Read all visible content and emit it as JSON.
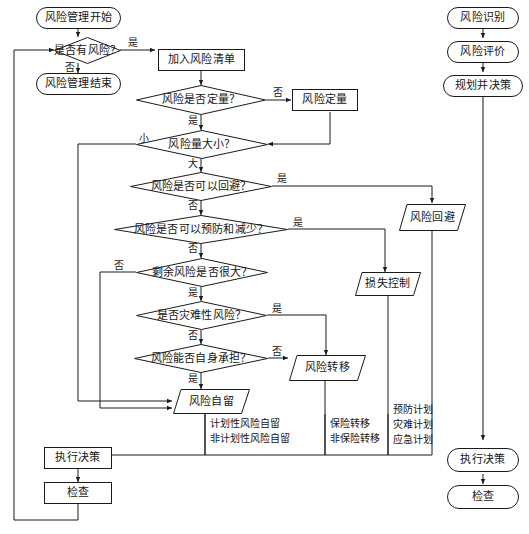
{
  "diagram": {
    "language": "zh-CN",
    "stroke_color": "#1a1a1a",
    "text_color": "#151515",
    "background": "#ffffff"
  },
  "nodes": {
    "start": "风险管理开始",
    "has_risk": "是否有风险？",
    "end": "风险管理结束",
    "add_list": "加入风险清单",
    "is_quant": "风险是否定量？",
    "quantify": "风险定量",
    "risk_size": "风险量大小？",
    "can_avoid": "风险是否可以回避？",
    "can_prevent": "风险是否可以预防和减少？",
    "residual_big": "剩余风险是否很大？",
    "is_catastrophic": "是否灾难性风险？",
    "can_bear": "风险能否自身承担？",
    "avoidance": "风险回避",
    "loss_control": "损失控制",
    "transfer": "风险转移",
    "retention": "风险自留",
    "execute_left": "执行决策",
    "check_left": "检查"
  },
  "right_column": {
    "identify": "风险识别",
    "evaluate": "风险评价",
    "plan_decide": "规划并决策",
    "execute": "执行决策",
    "check": "检查"
  },
  "edge_labels": {
    "has_risk_yes": "是",
    "has_risk_no": "否",
    "is_quant_no": "否",
    "is_quant_yes": "是",
    "size_small": "小",
    "size_large": "大",
    "avoid_yes": "是",
    "avoid_no": "否",
    "prevent_yes": "是",
    "prevent_no": "否",
    "residual_no": "否",
    "residual_yes": "是",
    "catastrophic_yes": "是",
    "catastrophic_no": "否",
    "bear_no": "否",
    "bear_yes": "是"
  },
  "notes": {
    "retention_line1": "计划性风险自留",
    "retention_line2": "非计划性风险自留",
    "transfer_line1": "保险转移",
    "transfer_line2": "非保险转移",
    "control_line1": "预防计划",
    "control_line2": "灾难计划",
    "control_line3": "应急计划"
  }
}
